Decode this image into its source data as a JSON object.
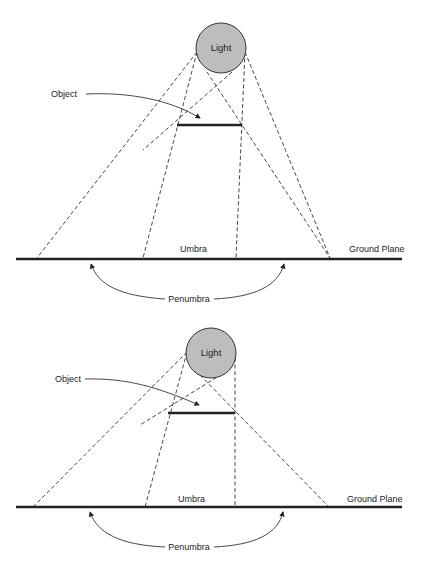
{
  "diagrams": [
    {
      "id": "top",
      "light_label": "Light",
      "object_label": "Object",
      "umbra_label": "Umbra",
      "ground_label": "Ground Plane",
      "penumbra_label": "Penumbra"
    },
    {
      "id": "bottom",
      "light_label": "Light",
      "object_label": "Object",
      "umbra_label": "Umbra",
      "ground_label": "Ground Plane",
      "penumbra_label": "Penumbra"
    }
  ],
  "colors": {
    "light_fill": "#bdbdbd",
    "line": "#222222",
    "background": "#ffffff"
  }
}
